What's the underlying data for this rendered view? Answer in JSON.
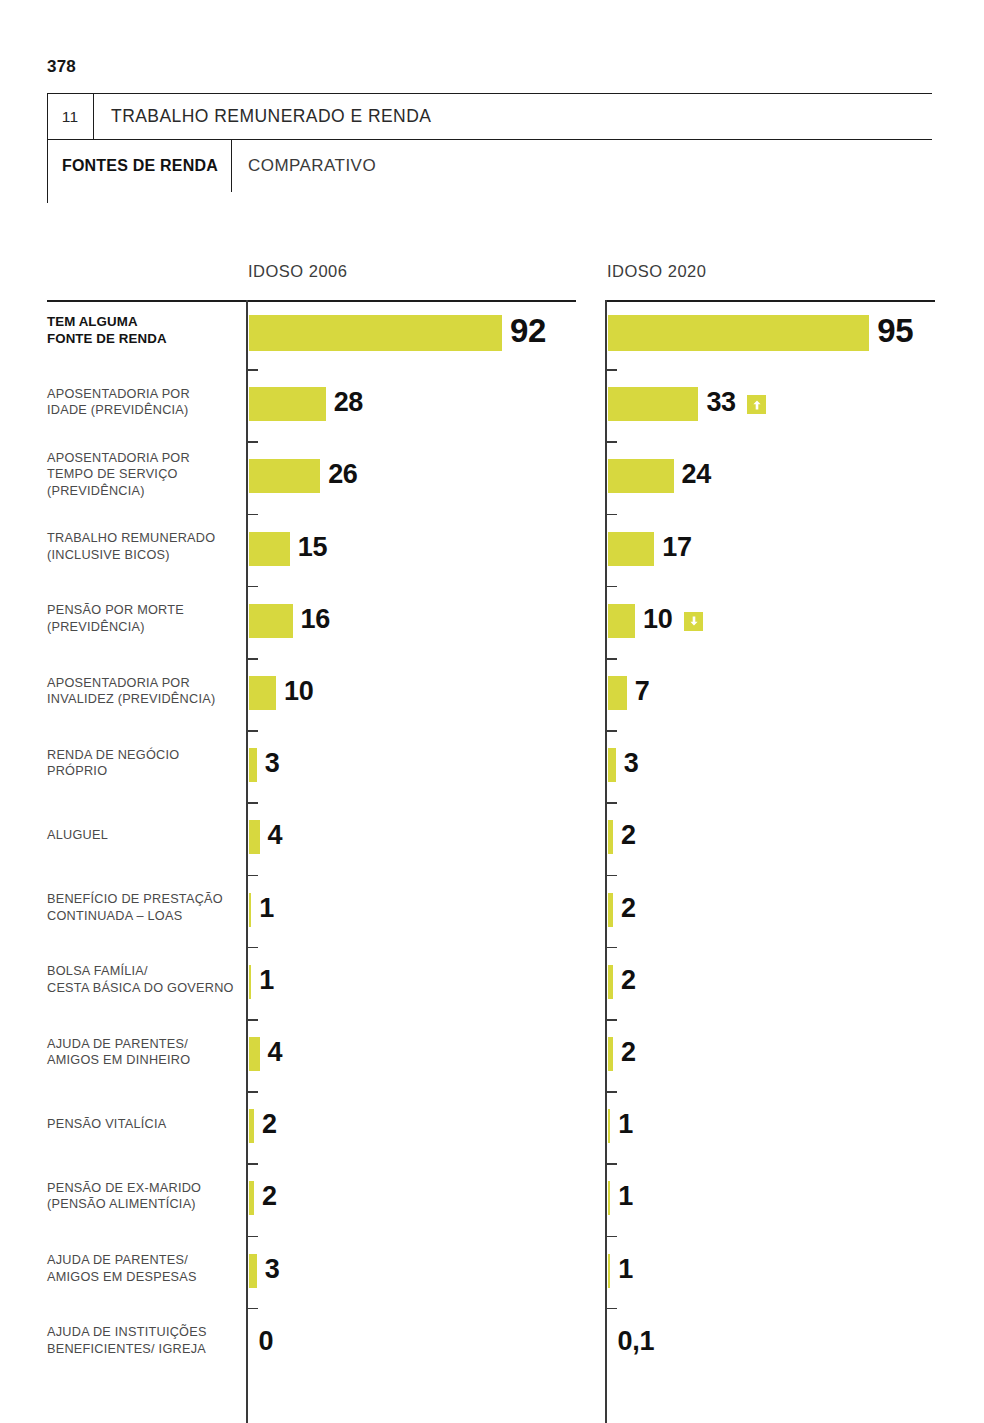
{
  "page": {
    "number": "378"
  },
  "header": {
    "chapter_number": "11",
    "chapter_title": "TRABALHO REMUNERADO E RENDA",
    "section_name": "FONTES DE RENDA",
    "section_kind": "COMPARATIVO"
  },
  "chart_data": {
    "type": "bar",
    "orientation": "horizontal",
    "title": "FONTES DE RENDA",
    "subtitle": "COMPARATIVO",
    "xlabel": "",
    "ylabel": "",
    "xlim": [
      0,
      100
    ],
    "grid": false,
    "legend_position": "top",
    "value_unit": "%",
    "categories": [
      "TEM ALGUMA FONTE DE RENDA",
      "APOSENTADORIA POR IDADE (PREVIDÊNCIA)",
      "APOSENTADORIA POR TEMPO DE SERVIÇO (PREVIDÊNCIA)",
      "TRABALHO REMUNERADO (INCLUSIVE BICOS)",
      "PENSÃO POR MORTE (PREVIDÊNCIA)",
      "APOSENTADORIA POR INVALIDEZ (PREVIDÊNCIA)",
      "RENDA DE NEGÓCIO PRÓPRIO",
      "ALUGUEL",
      "BENEFÍCIO DE PRESTAÇÃO CONTINUADA – LOAS",
      "BOLSA FAMÍLIA/ CESTA BÁSICA DO GOVERNO",
      "AJUDA DE PARENTES/ AMIGOS EM DINHEIRO",
      "PENSÃO VITALÍCIA",
      "PENSÃO DE EX-MARIDO (PENSÃO ALIMENTÍCIA)",
      "AJUDA DE PARENTES/ AMIGOS EM DESPESAS",
      "AJUDA DE INSTITUIÇÕES BENEFICIENTES/ IGREJA"
    ],
    "series": [
      {
        "name": "IDOSO 2006",
        "values": [
          92,
          28,
          26,
          15,
          16,
          10,
          3,
          4,
          1,
          1,
          4,
          2,
          2,
          3,
          0
        ],
        "labels": [
          "92",
          "28",
          "26",
          "15",
          "16",
          "10",
          "3",
          "4",
          "1",
          "1",
          "4",
          "2",
          "2",
          "3",
          "0"
        ]
      },
      {
        "name": "IDOSO 2020",
        "values": [
          95,
          33,
          24,
          17,
          10,
          7,
          3,
          2,
          2,
          2,
          2,
          1,
          1,
          1,
          0.1
        ],
        "labels": [
          "95",
          "33",
          "24",
          "17",
          "10",
          "7",
          "3",
          "2",
          "2",
          "2",
          "2",
          "1",
          "1",
          "1",
          "0,1"
        ],
        "trends": [
          null,
          "up",
          null,
          null,
          "down",
          null,
          null,
          null,
          null,
          null,
          null,
          null,
          null,
          null,
          null
        ]
      }
    ]
  },
  "rows": [
    {
      "label_line1": "TEM ALGUMA",
      "label_line2": "FONTE DE RENDA",
      "label_line3": "",
      "bold": true,
      "left_value": "92",
      "right_value": "95",
      "trend": ""
    },
    {
      "label_line1": "APOSENTADORIA POR",
      "label_line2": "IDADE (PREVIDÊNCIA)",
      "label_line3": "",
      "bold": false,
      "left_value": "28",
      "right_value": "33",
      "trend": "up"
    },
    {
      "label_line1": "APOSENTADORIA POR",
      "label_line2": "TEMPO DE SERVIÇO",
      "label_line3": "(PREVIDÊNCIA)",
      "bold": false,
      "left_value": "26",
      "right_value": "24",
      "trend": ""
    },
    {
      "label_line1": "TRABALHO REMUNERADO",
      "label_line2": "(INCLUSIVE BICOS)",
      "label_line3": "",
      "bold": false,
      "left_value": "15",
      "right_value": "17",
      "trend": ""
    },
    {
      "label_line1": "PENSÃO POR MORTE",
      "label_line2": "(PREVIDÊNCIA)",
      "label_line3": "",
      "bold": false,
      "left_value": "16",
      "right_value": "10",
      "trend": "down"
    },
    {
      "label_line1": "APOSENTADORIA POR",
      "label_line2": "INVALIDEZ (PREVIDÊNCIA)",
      "label_line3": "",
      "bold": false,
      "left_value": "10",
      "right_value": "7",
      "trend": ""
    },
    {
      "label_line1": "RENDA DE NEGÓCIO",
      "label_line2": "PRÓPRIO",
      "label_line3": "",
      "bold": false,
      "left_value": "3",
      "right_value": "3",
      "trend": ""
    },
    {
      "label_line1": "ALUGUEL",
      "label_line2": "",
      "label_line3": "",
      "bold": false,
      "left_value": "4",
      "right_value": "2",
      "trend": ""
    },
    {
      "label_line1": "BENEFÍCIO DE PRESTAÇÃO",
      "label_line2": "CONTINUADA – LOAS",
      "label_line3": "",
      "bold": false,
      "left_value": "1",
      "right_value": "2",
      "trend": ""
    },
    {
      "label_line1": "BOLSA FAMÍLIA/",
      "label_line2": "CESTA BÁSICA DO GOVERNO",
      "label_line3": "",
      "bold": false,
      "left_value": "1",
      "right_value": "2",
      "trend": ""
    },
    {
      "label_line1": "AJUDA DE PARENTES/",
      "label_line2": "AMIGOS EM DINHEIRO",
      "label_line3": "",
      "bold": false,
      "left_value": "4",
      "right_value": "2",
      "trend": ""
    },
    {
      "label_line1": "PENSÃO VITALÍCIA",
      "label_line2": "",
      "label_line3": "",
      "bold": false,
      "left_value": "2",
      "right_value": "1",
      "trend": ""
    },
    {
      "label_line1": "PENSÃO DE EX-MARIDO",
      "label_line2": "(PENSÃO ALIMENTÍCIA)",
      "label_line3": "",
      "bold": false,
      "left_value": "2",
      "right_value": "1",
      "trend": ""
    },
    {
      "label_line1": "AJUDA DE PARENTES/",
      "label_line2": "AMIGOS EM DESPESAS",
      "label_line3": "",
      "bold": false,
      "left_value": "3",
      "right_value": "1",
      "trend": ""
    },
    {
      "label_line1": "AJUDA DE INSTITUIÇÕES",
      "label_line2": "BENEFICIENTES/ IGREJA",
      "label_line3": "",
      "bold": false,
      "left_value": "0",
      "right_value": "0,1",
      "trend": ""
    }
  ],
  "columns": {
    "left_title": "IDOSO 2006",
    "right_title": "IDOSO 2020"
  },
  "colors": {
    "bar": "#d7d83f",
    "rule": "#1d1d1d",
    "label": "#4a4a4a",
    "value": "#101010"
  }
}
